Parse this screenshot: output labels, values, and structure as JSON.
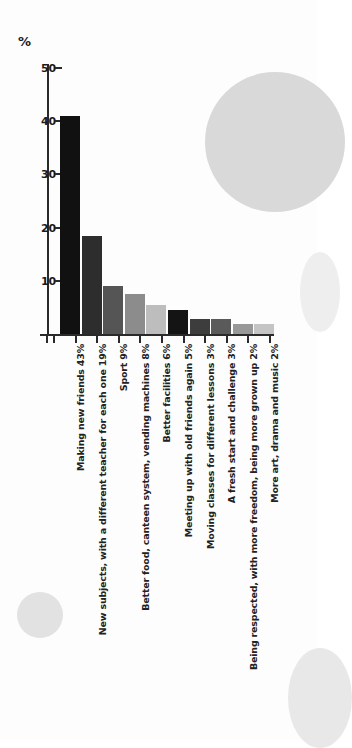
{
  "chart_data": {
    "type": "bar",
    "title": "",
    "subtitle": "",
    "xlabel": "",
    "ylabel": "%",
    "ylim": [
      0,
      50
    ],
    "yticks": [
      10,
      20,
      30,
      40,
      50
    ],
    "grid": false,
    "legend": "none",
    "orientation": "vertical",
    "categories": [
      "Making new friends 43%",
      "New subjects, with a different teacher for each one 19%",
      "Sport 9%",
      "Better food, canteen system, vending machines 8%",
      "Better facilities 6%",
      "Meeting up with old friends again 5%",
      "Moving classes for different lessons 3%",
      "A fresh start and challenge 3%",
      "Being respected, with more freedom, being more grown up 2%",
      "More art, drama and music 2%"
    ],
    "category_names": [
      "Making new friends",
      "New subjects, with a different teacher for each one",
      "Sport",
      "Better food, canteen system, vending machines",
      "Better facilities",
      "Meeting up with old friends again",
      "Moving classes for different lessons",
      "A fresh start and challenge",
      "Being respected, with more freedom, being more grown up",
      "More art, drama and music"
    ],
    "values": [
      43,
      19,
      9,
      8,
      6,
      5,
      3,
      3,
      2,
      2
    ],
    "value_labels": [
      "43%",
      "19%",
      "9%",
      "8%",
      "6%",
      "5%",
      "3%",
      "3%",
      "2%",
      "2%"
    ],
    "bar_drawn_heights": [
      41,
      18.5,
      9,
      7.5,
      5.5,
      4.5,
      2.8,
      2.8,
      1.8,
      1.8
    ],
    "bar_colors": [
      "#111111",
      "#2d2d2d",
      "#555555",
      "#8c8c8c",
      "#bdbdbd",
      "#141414",
      "#3d3d3d",
      "#5a5a5a",
      "#989898",
      "#c4c4c4"
    ],
    "axis_color": "#2a2a2a",
    "background_color": "#fdfdfd"
  },
  "decor": {
    "circle_large_color": "#d9d9d9",
    "circle_small_color": "#e2e2e2",
    "circle_right_mid_color": "#eeeeee",
    "circle_right_bottom_color": "#e8e8e8"
  }
}
